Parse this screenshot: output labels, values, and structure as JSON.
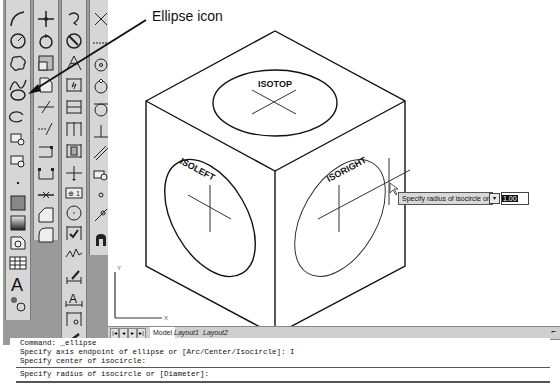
{
  "annotation": {
    "label": "Ellipse icon"
  },
  "drawing": {
    "faces": [
      {
        "label": "ISOTOP"
      },
      {
        "label": "ISOLEFT"
      },
      {
        "label": "ISORIGHT"
      }
    ],
    "ucs": {
      "x_label": "X",
      "y_label": "Y"
    }
  },
  "tooltip": {
    "prompt": "Specify radius of isocircle or",
    "options_button": "▾",
    "input_value": "1.00"
  },
  "layout_tabs": {
    "nav": [
      "|◂",
      "◂",
      "▸",
      "▸|"
    ],
    "tabs": [
      "Model",
      "Layout1",
      "Layout2"
    ],
    "active": "Model"
  },
  "command_window": {
    "lines": [
      "Command: _ellipse",
      "Specify axis endpoint of ellipse or [Arc/Center/Isocircle]: I",
      "Specify center of isocircle:"
    ],
    "current_prompt": "Specify radius of isocircle or [Diameter]:"
  },
  "toolbars": {
    "draw": [
      "arc",
      "circle",
      "revision-cloud",
      "spline",
      "ellipse",
      "ellipse-arc",
      "insert-block",
      "make-block",
      "point",
      "hatch",
      "gradient",
      "region",
      "table",
      "multiline-text",
      "add-selected"
    ],
    "modify": [
      "move",
      "rotate",
      "scale",
      "stretch",
      "trim",
      "extend",
      "break-at-point",
      "break",
      "join",
      "chamfer",
      "fillet",
      "3d-array"
    ],
    "dimension": [
      "dim-arc",
      "dim-radius",
      "dim-diameter",
      "dim-angular",
      "quick-dim",
      "dim-baseline",
      "dim-continue",
      "dim-space",
      "dim-break",
      "tolerance",
      "center-mark",
      "inspect",
      "jogged-linear",
      "dim-edit",
      "dim-text-edit",
      "dim-update"
    ],
    "snap": [
      "snap-intersection",
      "snap-extension",
      "snap-center",
      "snap-quadrant",
      "snap-tangent",
      "snap-perpendicular",
      "snap-parallel",
      "snap-insert",
      "snap-node",
      "snap-nearest",
      "snap-none",
      "osnap-settings"
    ]
  }
}
